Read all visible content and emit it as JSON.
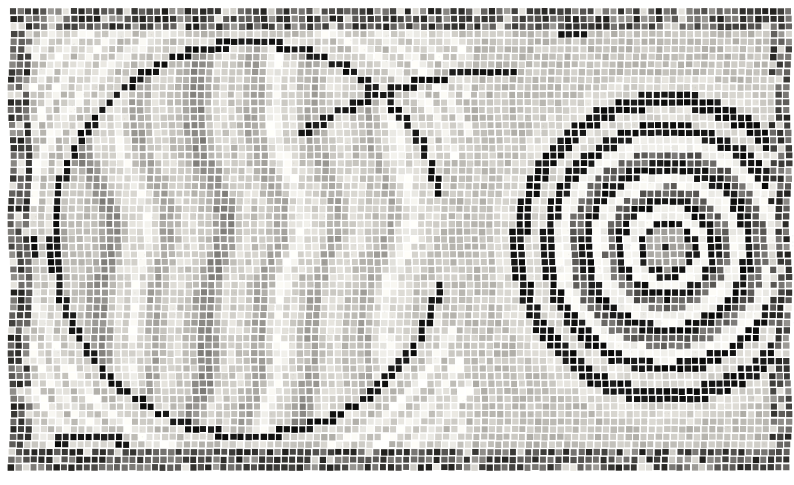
{
  "image": {
    "title": "Abstract grayscale mosaic panel",
    "medium": "tessera mosaic",
    "width": 794,
    "height": 485,
    "palette": {
      "background_white": "#ffffff",
      "tile_white": "#f2f1ec",
      "tile_light": "#d9d7d1",
      "tile_mid_light": "#c2c0ba",
      "tile_mid": "#a7a5a0",
      "tile_mid_dark": "#8b8985",
      "tile_dark": "#63615e",
      "tile_very_dark": "#33322f",
      "tile_black": "#141413",
      "grout": "#ffffff"
    },
    "margins": {
      "left": 9,
      "top": 8,
      "right": 0,
      "bottom": 17
    },
    "tile_size_px": 7.6,
    "grout_px": 1.1
  },
  "composition": {
    "regions": [
      {
        "name": "left-panel",
        "label": "Left panel with large circle and vertical wavy striations",
        "bounds": [
          9,
          8,
          470,
          468
        ]
      },
      {
        "name": "right-panel",
        "label": "Right panel with concentric target spiral",
        "bounds": [
          470,
          8,
          794,
          468
        ]
      }
    ],
    "motifs": [
      {
        "name": "large-circle",
        "label": "Large outlined circle, left panel",
        "center": [
          250,
          240
        ],
        "radius": 196,
        "outline": "black tesserae, single course",
        "fill": "vertical wavy striations, light to mid grey"
      },
      {
        "name": "concentric-target",
        "label": "Concentric target / spiral, right panel",
        "center": [
          668,
          249
        ],
        "rings": [
          {
            "r": 22,
            "tone": "mid",
            "label": "core-disc"
          },
          {
            "r": 30,
            "tone": "black",
            "label": "ring-1-black"
          },
          {
            "r": 42,
            "tone": "white",
            "label": "ring-2-white"
          },
          {
            "r": 52,
            "tone": "black",
            "label": "ring-3-black"
          },
          {
            "r": 63,
            "tone": "dark",
            "label": "ring-4-dark"
          },
          {
            "r": 76,
            "tone": "white",
            "label": "ring-5-white"
          },
          {
            "r": 88,
            "tone": "black",
            "label": "ring-6-black"
          },
          {
            "r": 100,
            "tone": "dark",
            "label": "ring-7-dark"
          },
          {
            "r": 113,
            "tone": "white",
            "label": "ring-8-white"
          },
          {
            "r": 126,
            "tone": "black",
            "label": "ring-9-black"
          },
          {
            "r": 140,
            "tone": "light",
            "label": "ring-10-light"
          },
          {
            "r": 156,
            "tone": "black",
            "label": "ring-11-black"
          },
          {
            "r": 172,
            "tone": "light",
            "label": "ring-12-light"
          }
        ],
        "center_dot": {
          "x": 663,
          "y": 251,
          "radius": 5,
          "tone": "black"
        }
      },
      {
        "name": "left-rosette",
        "label": "Small dark rosette on left border",
        "center": [
          19,
          246
        ],
        "radius": 19
      },
      {
        "name": "corner-rectangle",
        "label": "Small dark-outlined rectangle, lower left",
        "bounds": [
          59,
          437,
          122,
          462
        ]
      },
      {
        "name": "sweeping-arc-upper-right",
        "label": "Black sweeping arc across upper right",
        "center": [
          520,
          470
        ],
        "radius": 400
      },
      {
        "name": "border-band",
        "label": "Dark mottled tesserae border band framing the panel",
        "thickness": 22
      }
    ]
  }
}
